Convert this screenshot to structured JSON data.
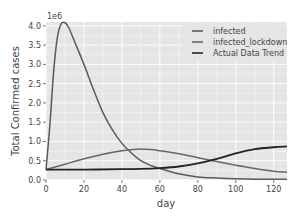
{
  "chart_data": {
    "type": "line",
    "title": "",
    "xlabel": "day",
    "ylabel": "Total Confirmed cases",
    "y_offset_label": "1e6",
    "xlim": [
      0,
      127
    ],
    "ylim": [
      0,
      4.1
    ],
    "xticks": [
      0,
      20,
      40,
      60,
      80,
      100,
      120
    ],
    "xtick_labels": [
      "0",
      "20",
      "40",
      "60",
      "80",
      "100",
      "120"
    ],
    "yticks": [
      0,
      0.5,
      1.0,
      1.5,
      2.0,
      2.5,
      3.0,
      3.5,
      4.0
    ],
    "ytick_labels": [
      "0.0",
      "0.5",
      "1.0",
      "1.5",
      "2.0",
      "2.5",
      "3.0",
      "3.5",
      "4.0"
    ],
    "grid": true,
    "legend_position": "upper right",
    "series": [
      {
        "name": "infected",
        "color": "#5a5a5a",
        "x": [
          0,
          2,
          4,
          6,
          8,
          10,
          12,
          15,
          20,
          25,
          30,
          35,
          40,
          45,
          50,
          55,
          60,
          70,
          80,
          90,
          100,
          110,
          120,
          127
        ],
        "y": [
          0.27,
          1.4,
          2.8,
          3.7,
          4.05,
          4.08,
          3.95,
          3.6,
          3.0,
          2.35,
          1.75,
          1.3,
          0.95,
          0.7,
          0.5,
          0.38,
          0.3,
          0.16,
          0.08,
          0.05,
          0.03,
          0.02,
          0.02,
          0.02
        ]
      },
      {
        "name": "infected_lockdown",
        "color": "#666666",
        "x": [
          0,
          10,
          20,
          30,
          40,
          48,
          55,
          60,
          70,
          80,
          90,
          100,
          110,
          120,
          127
        ],
        "y": [
          0.27,
          0.41,
          0.55,
          0.67,
          0.76,
          0.8,
          0.79,
          0.76,
          0.68,
          0.58,
          0.48,
          0.38,
          0.3,
          0.23,
          0.2
        ]
      },
      {
        "name": "Actual Data Trend",
        "color": "#222222",
        "x": [
          0,
          20,
          40,
          50,
          60,
          70,
          80,
          90,
          100,
          110,
          120,
          127
        ],
        "y": [
          0.27,
          0.27,
          0.28,
          0.29,
          0.31,
          0.35,
          0.43,
          0.55,
          0.69,
          0.8,
          0.85,
          0.87
        ]
      }
    ]
  },
  "legend": {
    "items": [
      "infected",
      "infected_lockdown",
      "Actual Data Trend"
    ]
  },
  "style": {
    "axes_bg": "#e5e5e5",
    "grid_color": "#ffffff",
    "tick_color": "#555555"
  }
}
